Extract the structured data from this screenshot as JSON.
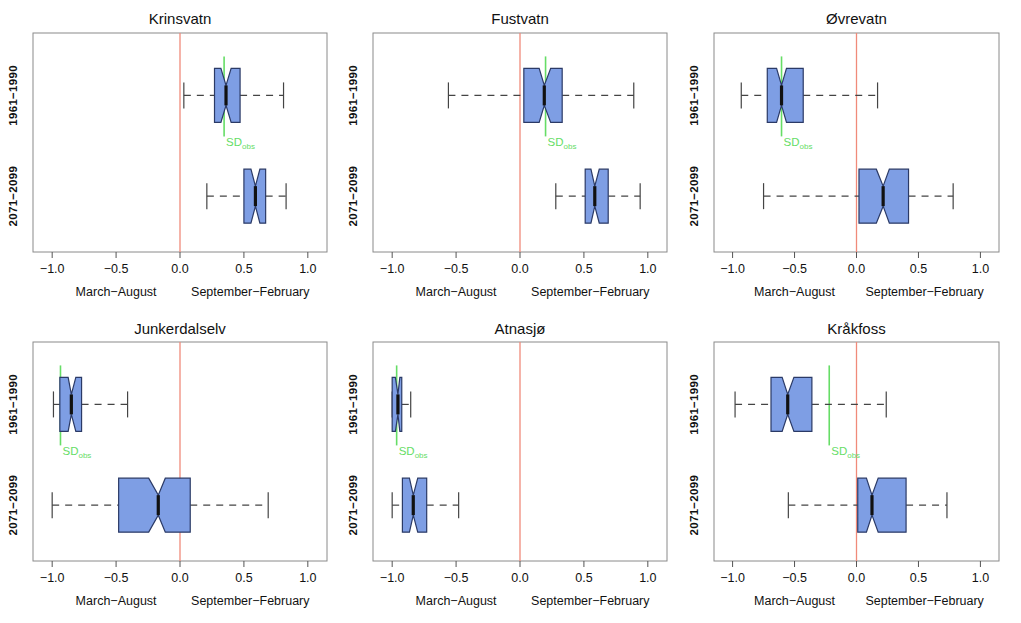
{
  "figure": {
    "rows": 2,
    "cols": 3,
    "axis": {
      "xlim": [
        -1.15,
        1.15
      ],
      "ticks": [
        -1.0,
        -0.5,
        0.0,
        0.5,
        1.0
      ],
      "tick_labels": [
        "-1.0",
        "-0.5",
        "0.0",
        "0.5",
        "1.0"
      ],
      "y_categories": [
        "1961-1990",
        "2071-2099"
      ],
      "left_season_label": "March-August",
      "right_season_label": "September-February",
      "reference_line_value": 0.0
    },
    "colors": {
      "box_fill": "#7e9ee4",
      "box_border": "#2b3a66",
      "median": "#111111",
      "whisker": "#444444",
      "reference_line": "#f08a7a",
      "sd_marker": "#66dd66",
      "frame": "#8a8a8a"
    },
    "sd_label_text": "SD",
    "sd_label_sub": "obs"
  },
  "chart_data": {
    "type": "box",
    "xlabel": "",
    "ylabel": "",
    "xlim": [
      -1.15,
      1.15
    ],
    "grid": false,
    "legend": "none",
    "categories": [
      "1961-1990",
      "2071-2099"
    ],
    "panels": [
      {
        "title": "Krinsvatn",
        "row": 0,
        "col": 0,
        "sd_obs": 0.345,
        "boxes": [
          {
            "group": "1961-1990",
            "whisker_low": 0.03,
            "q1": 0.27,
            "median": 0.36,
            "q3": 0.47,
            "whisker_high": 0.81,
            "notch_low": 0.32,
            "notch_high": 0.4
          },
          {
            "group": "2071-2099",
            "whisker_low": 0.21,
            "q1": 0.5,
            "median": 0.59,
            "q3": 0.67,
            "whisker_high": 0.83,
            "notch_low": 0.555,
            "notch_high": 0.625
          }
        ]
      },
      {
        "title": "Fustvatn",
        "row": 0,
        "col": 1,
        "sd_obs": 0.2,
        "boxes": [
          {
            "group": "1961-1990",
            "whisker_low": -0.56,
            "q1": 0.03,
            "median": 0.19,
            "q3": 0.33,
            "whisker_high": 0.89,
            "notch_low": 0.15,
            "notch_high": 0.24
          },
          {
            "group": "2071-2099",
            "whisker_low": 0.28,
            "q1": 0.51,
            "median": 0.585,
            "q3": 0.69,
            "whisker_high": 0.94,
            "notch_low": 0.555,
            "notch_high": 0.62
          }
        ]
      },
      {
        "title": "Øvrevatn",
        "row": 0,
        "col": 2,
        "sd_obs": -0.605,
        "boxes": [
          {
            "group": "1961-1990",
            "whisker_low": -0.93,
            "q1": -0.72,
            "median": -0.605,
            "q3": -0.43,
            "whisker_high": 0.17,
            "notch_low": -0.645,
            "notch_high": -0.565
          },
          {
            "group": "2071-2099",
            "whisker_low": -0.75,
            "q1": 0.02,
            "median": 0.215,
            "q3": 0.42,
            "whisker_high": 0.78,
            "notch_low": 0.16,
            "notch_high": 0.265
          }
        ]
      },
      {
        "title": "Junkerdalselv",
        "row": 1,
        "col": 0,
        "sd_obs": -0.935,
        "boxes": [
          {
            "group": "1961-1990",
            "whisker_low": -0.99,
            "q1": -0.94,
            "median": -0.85,
            "q3": -0.77,
            "whisker_high": -0.41,
            "notch_low": -0.875,
            "notch_high": -0.815
          },
          {
            "group": "2071-2099",
            "whisker_low": -1.0,
            "q1": -0.48,
            "median": -0.17,
            "q3": 0.08,
            "whisker_high": 0.69,
            "notch_low": -0.245,
            "notch_high": -0.115
          }
        ]
      },
      {
        "title": "Atnasjø",
        "row": 1,
        "col": 1,
        "sd_obs": -0.965,
        "boxes": [
          {
            "group": "1961-1990",
            "whisker_low": -1.0,
            "q1": -1.0,
            "median": -0.955,
            "q3": -0.925,
            "whisker_high": -0.855,
            "notch_low": -0.975,
            "notch_high": -0.94
          },
          {
            "group": "2071-2099",
            "whisker_low": -1.0,
            "q1": -0.92,
            "median": -0.835,
            "q3": -0.73,
            "whisker_high": -0.48,
            "notch_low": -0.865,
            "notch_high": -0.8
          }
        ]
      },
      {
        "title": "Kråkfoss",
        "row": 1,
        "col": 2,
        "sd_obs": -0.22,
        "boxes": [
          {
            "group": "1961-1990",
            "whisker_low": -0.98,
            "q1": -0.69,
            "median": -0.555,
            "q3": -0.36,
            "whisker_high": 0.24,
            "notch_low": -0.6,
            "notch_high": -0.505
          },
          {
            "group": "2071-2099",
            "whisker_low": -0.55,
            "q1": 0.01,
            "median": 0.125,
            "q3": 0.4,
            "whisker_high": 0.73,
            "notch_low": 0.08,
            "notch_high": 0.175
          }
        ]
      }
    ]
  }
}
